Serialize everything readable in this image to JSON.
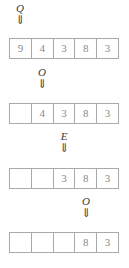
{
  "diagram": {
    "cell_count": 5,
    "colors": {
      "border": "#a9a9a9",
      "digit": "#8a8a8a",
      "label": "#3a3a3a",
      "background": "#ffffff"
    },
    "arrow_glyph": "⇓",
    "arrow_icon_name": "double-down-arrow-icon",
    "stages": [
      {
        "label": "Q",
        "arrow": "⇓",
        "pointer_index": 0,
        "cells": [
          "9",
          "4",
          "3",
          "8",
          "3"
        ],
        "empty": [
          false,
          false,
          false,
          false,
          false
        ]
      },
      {
        "label": "O",
        "arrow": "⇓",
        "pointer_index": 1,
        "cells": [
          "",
          "4",
          "3",
          "8",
          "3"
        ],
        "empty": [
          true,
          false,
          false,
          false,
          false
        ]
      },
      {
        "label": "E",
        "arrow": "⇓",
        "pointer_index": 2,
        "cells": [
          "",
          "",
          "3",
          "8",
          "3"
        ],
        "empty": [
          true,
          true,
          false,
          false,
          false
        ]
      },
      {
        "label": "O",
        "arrow": "⇓",
        "pointer_index": 3,
        "cells": [
          "",
          "",
          "",
          "8",
          "3"
        ],
        "empty": [
          true,
          true,
          true,
          false,
          false
        ]
      }
    ]
  }
}
